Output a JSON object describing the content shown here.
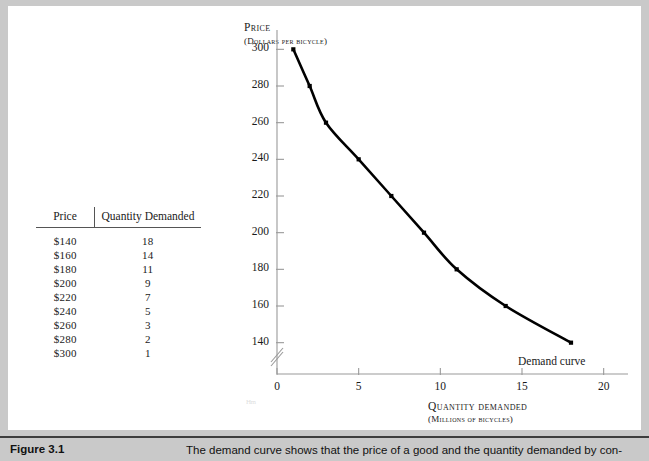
{
  "figure": {
    "number_label": "Figure 3.1",
    "caption": "The demand curve shows that the price of a good and the quantity demanded by con-"
  },
  "table": {
    "headers": [
      "Price",
      "Quantity Demanded"
    ],
    "rows": [
      [
        "$140",
        "18"
      ],
      [
        "$160",
        "14"
      ],
      [
        "$180",
        "11"
      ],
      [
        "$200",
        "9"
      ],
      [
        "$220",
        "7"
      ],
      [
        "$240",
        "5"
      ],
      [
        "$260",
        "3"
      ],
      [
        "$280",
        "2"
      ],
      [
        "$300",
        "1"
      ]
    ]
  },
  "chart_data": {
    "type": "line",
    "title": "",
    "ylabel": "Price",
    "ylabel_sub": "(Dollars per bicycle)",
    "xlabel": "Quantity demanded",
    "xlabel_sub": "(Millions of bicycles)",
    "x": [
      1,
      2,
      3,
      5,
      7,
      9,
      11,
      14,
      18
    ],
    "values": [
      300,
      280,
      260,
      240,
      220,
      200,
      180,
      160,
      140
    ],
    "series": [
      {
        "name": "Demand curve",
        "x": [
          1,
          2,
          3,
          5,
          7,
          9,
          11,
          14,
          18
        ],
        "values": [
          300,
          280,
          260,
          240,
          220,
          200,
          180,
          160,
          140
        ]
      }
    ],
    "xlim": [
      0,
      21
    ],
    "ylim": [
      130,
      310
    ],
    "xticks": [
      "0",
      "5",
      "10",
      "15",
      "20"
    ],
    "xtick_values": [
      0,
      5,
      10,
      15,
      20
    ],
    "yticks": [
      "140",
      "160",
      "180",
      "200",
      "220",
      "240",
      "260",
      "280",
      "300"
    ],
    "ytick_values": [
      140,
      160,
      180,
      200,
      220,
      240,
      260,
      280,
      300
    ],
    "grid": false,
    "y_axis_break": true,
    "legend_position": "none",
    "annotations": [
      {
        "text": "Demand curve",
        "x": 18,
        "y": 140
      }
    ],
    "curve_color": "#000000",
    "marker_shape": "square",
    "axis_color": "#9a9a9a"
  },
  "colors": {
    "page_background": "#c9c9c9",
    "panel_background": "#ffffff",
    "caption_rule": "#3d3d3d",
    "text": "#1a1a1a"
  },
  "artifact_text": "Hm"
}
